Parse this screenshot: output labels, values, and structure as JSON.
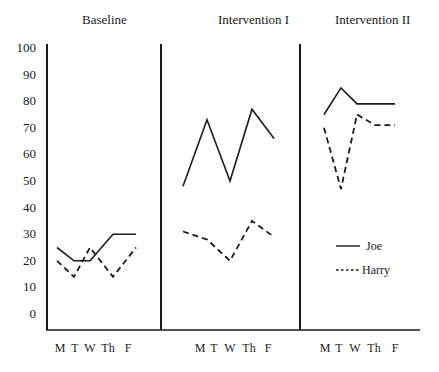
{
  "chart_data": {
    "type": "line",
    "title": "",
    "xlabel": "",
    "ylabel": "",
    "ylim": [
      0,
      100
    ],
    "yticks": [
      0,
      10,
      20,
      30,
      40,
      50,
      60,
      70,
      80,
      90,
      100
    ],
    "grid": false,
    "legend_position": "right, inside Intervention II panel",
    "phases": [
      {
        "label": "Baseline",
        "categories": [
          "M",
          "T",
          "W",
          "Th",
          "F"
        ],
        "series": [
          {
            "name": "Joe",
            "style": "solid",
            "values": [
              25,
              20,
              20,
              30,
              30
            ]
          },
          {
            "name": "Harry",
            "style": "dashed",
            "values": [
              20,
              14,
              25,
              14,
              25
            ]
          }
        ]
      },
      {
        "label": "Intervention I",
        "categories": [
          "M",
          "T",
          "W",
          "Th",
          "F"
        ],
        "series": [
          {
            "name": "Joe",
            "style": "solid",
            "values": [
              48,
              73,
              50,
              77,
              66
            ]
          },
          {
            "name": "Harry",
            "style": "dashed",
            "values": [
              31,
              28,
              20,
              35,
              29
            ]
          }
        ]
      },
      {
        "label": "Intervention II",
        "categories": [
          "M",
          "T",
          "W",
          "Th",
          "F"
        ],
        "series": [
          {
            "name": "Joe",
            "style": "solid",
            "values": [
              75,
              85,
              79,
              79,
              79
            ]
          },
          {
            "name": "Harry",
            "style": "dashed",
            "values": [
              70,
              47,
              75,
              71,
              71
            ]
          }
        ]
      }
    ],
    "legend": [
      {
        "name": "Joe",
        "style": "solid"
      },
      {
        "name": "Harry",
        "style": "dashed"
      }
    ]
  },
  "layout": {
    "axis_x": 47,
    "baseline_y": 330,
    "y0_px": 314,
    "y100_px": 48,
    "dividers_x": [
      161,
      300
    ],
    "axis_right": 420,
    "phase_title_x": [
      82,
      218,
      335
    ],
    "phase_title_y": 24,
    "point_x": [
      [
        57,
        74,
        90,
        113,
        136
      ],
      [
        183,
        207,
        230,
        252,
        274
      ],
      [
        324,
        341,
        357,
        375,
        395
      ]
    ],
    "day_label_x": [
      [
        60,
        75,
        90,
        108,
        128
      ],
      [
        200,
        214,
        230,
        249,
        268
      ],
      [
        325,
        339,
        355,
        374,
        395
      ]
    ],
    "day_label_y": 352,
    "legend": {
      "x1": 336,
      "x2": 360,
      "text_x": 362,
      "y_rows": [
        246,
        270
      ]
    },
    "colors": {
      "ink": "#1a1a1a",
      "background": "#ffffff"
    }
  }
}
